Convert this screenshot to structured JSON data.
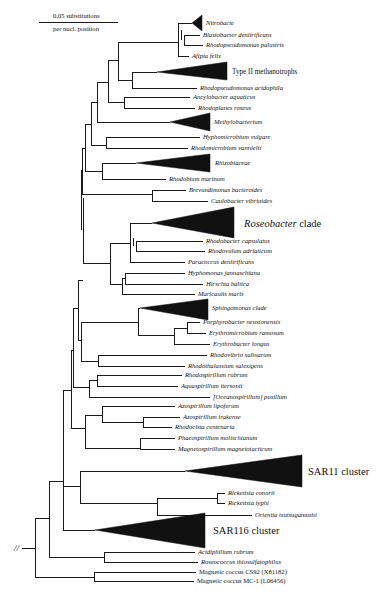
{
  "scale_bar": {
    "line_label_top": "0.05 substitutions",
    "line_label_bottom": "per nucl. position"
  },
  "clades": {
    "nitrobacte": "Nitrobacte",
    "type2": "Type II methanotrophs",
    "methylobacterium": "Methylobacterium",
    "rhizobiaceae": "Rhizobiaceae",
    "roseobacter_italic": "Roseobacter",
    "roseobacter_suffix": " clade",
    "sphingomonas": "Sphingomonas clade",
    "sar11": "SAR11 cluster",
    "sar116": "SAR116 cluster"
  },
  "taxa": {
    "blastobacter": "Blastobacter denitrificans",
    "rps_palustris": "Rhodopseudomonas palustris",
    "afipia": "Afipia felis",
    "rps_acidophila": "Rhodopseudomonas acidophila",
    "ancylobacter": "Ancylobacter aquaticus",
    "rhodoplanes": "Rhodoplanes roseus",
    "hyphomicrobium": "Hyphomicrobium vulgare",
    "rhodomicrobium": "Rhodomicrobium vannielii",
    "rhodobium": "Rhodobium marinum",
    "brevundimonas": "Brevundimonas bacteroides",
    "caulobacter": "Caulobacter vibrioides",
    "rhodobacter": "Rhodobacter capsulatus",
    "rhodovulum": "Rhodovulum adriaticum",
    "paracoccus": "Paracoccus denitrificans",
    "hyphomonas": "Hyphomonas jannaschiana",
    "hirschia": "Hirschia baltica",
    "maricaulis": "Maricaulis maris",
    "porphyrobacter": "Porphyrobacter neustonensis",
    "erythromicrobium": "Erythromicrobium ramosum",
    "erythrobacter": "Erythrobacter longus",
    "rhodovibrio": "Rhodovibrio salinarum",
    "rhodothalassium": "Rhodothalassium salexigens",
    "rhodospirillum": "Rhodospirillum rubrum",
    "aquaspirillum": "Aquaspirillum itersonii",
    "oceanospirillum": "[Oceanospirillum] pusillum",
    "azo_lipoferum": "Azospirillum lipoferum",
    "azo_irakense": "Azospirillum irakense",
    "rhodocista": "Rhodocista centenaria",
    "phaeospirillum": "Phaeospirillum molischianum",
    "magnetospirillum": "Magnetospirillum magnetotacticum",
    "rick_conorii": "Rickettsia conorii",
    "rick_typhi": "Rickettsia typhi",
    "orientia": "Orientia tsutsugamushi",
    "acidiphilium": "Acidiphilium rubrum",
    "roseococcus": "Roseococcus thiosulfatophilus",
    "mc_cs92": "Magnetic coccus CS92 (X81182)",
    "mc_mc1": "Magnetic coccus MC-1 (L06456)"
  },
  "root_break_symbol": "//"
}
